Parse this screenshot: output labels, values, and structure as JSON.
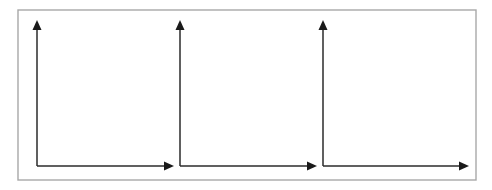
{
  "figure": {
    "title": "",
    "background_color": "#ffffff",
    "frame": {
      "name": "outer-border",
      "x": 18,
      "y": 10,
      "width": 458,
      "height": 170,
      "stroke_color": "#a8a8a8",
      "stroke_width": 1.4,
      "fill_color": "#ffffff"
    },
    "axis_style": {
      "line_color": "#2b2b2b",
      "arrowhead_color": "#1a1a1a",
      "line_width": 1.5,
      "arrowhead_length": 10,
      "arrowhead_half_width": 4.5
    }
  },
  "chart_data": {
    "type": "line",
    "title": "",
    "subtitle": "",
    "xlabel": "",
    "ylabel": "",
    "grid": false,
    "legend": [],
    "legend_position": "none",
    "annotations": [],
    "panels": [
      {
        "name": "panel-1",
        "index": 1,
        "origin_x": 37,
        "origin_y": 166,
        "y_axis_tip_y": 20,
        "x_axis_tip_x": 174,
        "x_axis_label": "",
        "y_axis_label": "",
        "x_ticks": [],
        "y_ticks": [],
        "x_tick_labels": [],
        "y_tick_labels": [],
        "series": []
      },
      {
        "name": "panel-2",
        "index": 2,
        "origin_x": 180,
        "origin_y": 166,
        "y_axis_tip_y": 20,
        "x_axis_tip_x": 317,
        "x_axis_label": "",
        "y_axis_label": "",
        "x_ticks": [],
        "y_ticks": [],
        "x_tick_labels": [],
        "y_tick_labels": [],
        "series": []
      },
      {
        "name": "panel-3",
        "index": 3,
        "origin_x": 323,
        "origin_y": 166,
        "y_axis_tip_y": 20,
        "x_axis_tip_x": 469,
        "x_axis_label": "",
        "y_axis_label": "",
        "x_ticks": [],
        "y_ticks": [],
        "x_tick_labels": [],
        "y_tick_labels": [],
        "series": []
      }
    ]
  }
}
